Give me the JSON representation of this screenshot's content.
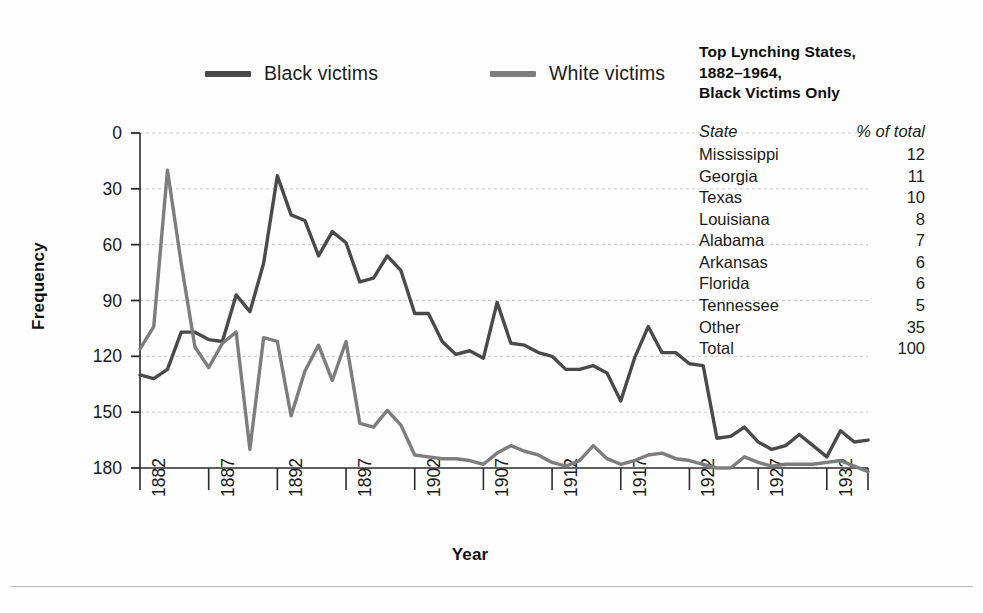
{
  "axes": {
    "ylabel": "Frequency",
    "xlabel": "Year",
    "yticks": [
      "180",
      "150",
      "120",
      "90",
      "60",
      "30",
      "0"
    ],
    "xticks": [
      "1882",
      "1887",
      "1892",
      "1897",
      "1902",
      "1907",
      "1912",
      "1917",
      "1922",
      "1927",
      "1932"
    ]
  },
  "legend": {
    "items": [
      {
        "label": "Black victims",
        "color": "#4a4a4a"
      },
      {
        "label": "White victims",
        "color": "#7d7d7d"
      }
    ]
  },
  "side_panel": {
    "title": "Top Lynching States, 1882–1964, Black Victims Only",
    "title_lines": [
      "Top Lynching States,",
      "1882–1964,",
      "Black Victims Only"
    ],
    "columns": [
      "State",
      "% of total"
    ],
    "rows": [
      {
        "state": "Mississippi",
        "pct": "12"
      },
      {
        "state": "Georgia",
        "pct": "11"
      },
      {
        "state": "Texas",
        "pct": "10"
      },
      {
        "state": "Louisiana",
        "pct": "8"
      },
      {
        "state": "Alabama",
        "pct": "7"
      },
      {
        "state": "Arkansas",
        "pct": "6"
      },
      {
        "state": "Florida",
        "pct": "6"
      },
      {
        "state": "Tennessee",
        "pct": "5"
      },
      {
        "state": "Other",
        "pct": "35"
      },
      {
        "state": "Total",
        "pct": "100"
      }
    ]
  },
  "chart_data": {
    "type": "line",
    "title": "",
    "xlabel": "Year",
    "ylabel": "Frequency",
    "xlim": [
      1882,
      1935
    ],
    "ylim": [
      0,
      180
    ],
    "yticks": [
      0,
      30,
      60,
      90,
      120,
      150,
      180
    ],
    "xticks": [
      1882,
      1887,
      1892,
      1897,
      1902,
      1907,
      1912,
      1917,
      1922,
      1927,
      1932
    ],
    "grid": "horizontal-dashed",
    "legend_position": "above-plot",
    "x": [
      1882,
      1883,
      1884,
      1885,
      1886,
      1887,
      1888,
      1889,
      1890,
      1891,
      1892,
      1893,
      1894,
      1895,
      1896,
      1897,
      1898,
      1899,
      1900,
      1901,
      1902,
      1903,
      1904,
      1905,
      1906,
      1907,
      1908,
      1909,
      1910,
      1911,
      1912,
      1913,
      1914,
      1915,
      1916,
      1917,
      1918,
      1919,
      1920,
      1921,
      1922,
      1923,
      1924,
      1925,
      1926,
      1927,
      1928,
      1929,
      1930,
      1931,
      1932,
      1933,
      1934,
      1935
    ],
    "series": [
      {
        "name": "Black victims",
        "color": "#4a4a4a",
        "values": [
          50,
          48,
          53,
          73,
          73,
          69,
          68,
          93,
          84,
          110,
          157,
          136,
          133,
          114,
          127,
          121,
          100,
          102,
          114,
          106,
          83,
          83,
          68,
          61,
          63,
          59,
          89,
          67,
          66,
          62,
          60,
          53,
          53,
          55,
          51,
          36,
          59,
          76,
          62,
          62,
          56,
          55,
          16,
          17,
          22,
          14,
          10,
          12,
          18,
          12,
          6,
          20,
          14,
          15
        ]
      },
      {
        "name": "White victims",
        "color": "#7d7d7d",
        "values": [
          64,
          76,
          160,
          110,
          65,
          54,
          67,
          73,
          10,
          70,
          68,
          28,
          52,
          66,
          47,
          68,
          24,
          22,
          31,
          23,
          7,
          6,
          5,
          5,
          4,
          2,
          8,
          12,
          9,
          7,
          3,
          1,
          4,
          12,
          5,
          2,
          4,
          7,
          8,
          5,
          4,
          2,
          0,
          0,
          6,
          3,
          1,
          2,
          2,
          2,
          3,
          4,
          1,
          -2
        ]
      }
    ]
  }
}
